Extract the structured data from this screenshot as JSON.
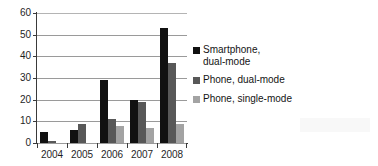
{
  "chart_data": {
    "type": "bar",
    "title": "",
    "subtitle": "",
    "xlabel": "",
    "ylabel": "",
    "categories": [
      "2004",
      "2005",
      "2006",
      "2007",
      "2008"
    ],
    "ylim": [
      0,
      60
    ],
    "yticks": [
      0,
      10,
      20,
      30,
      40,
      50,
      60
    ],
    "grid": "horizontal",
    "legend_position": "right",
    "series": [
      {
        "name": "Smartphone,\ndual-mode",
        "color": "#111111",
        "values": [
          5,
          6,
          29,
          20,
          53
        ]
      },
      {
        "name": "Phone, dual-mode",
        "color": "#585858",
        "values": [
          1,
          9,
          11,
          19,
          37
        ]
      },
      {
        "name": "Phone, single-mode",
        "color": "#a3a3a3",
        "values": [
          0,
          0,
          8,
          7,
          9
        ]
      }
    ]
  }
}
